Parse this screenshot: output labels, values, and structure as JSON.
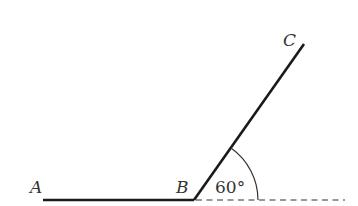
{
  "diagram": {
    "type": "angle-figure",
    "points": {
      "A": {
        "label": "A"
      },
      "B": {
        "label": "B"
      },
      "C": {
        "label": "C"
      }
    },
    "segments": [
      {
        "from": "A",
        "to": "B",
        "style": "solid"
      },
      {
        "from": "B",
        "to": "C",
        "style": "solid"
      },
      {
        "from": "B",
        "to": "extension",
        "style": "dashed"
      }
    ],
    "angle": {
      "label": "60°",
      "value_degrees": 60,
      "between": [
        "BC",
        "extension of AB"
      ]
    },
    "colors": {
      "line": "#1a1a1a",
      "text": "#333333",
      "background": "#ffffff"
    }
  }
}
